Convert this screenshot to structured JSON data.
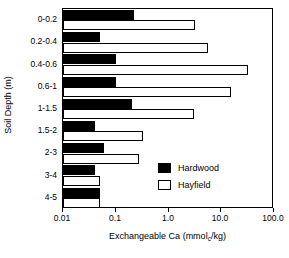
{
  "chart_data": {
    "type": "bar",
    "orientation": "horizontal",
    "title": "",
    "xlabel": "Exchangeable Ca (mmol",
    "xlabel_sub": "c",
    "xlabel_tail": "/kg)",
    "xlabel_full": "Exchangeable Ca (mmolc/kg)",
    "ylabel": "Soil Depth (m)",
    "xscale": "log",
    "xlim": [
      0.01,
      100.0
    ],
    "grid": false,
    "categories": [
      "0-0.2",
      "0.2-0.4",
      "0.4-0.6",
      "0.6-1",
      "1-1.5",
      "1.5-2",
      "2-3",
      "3-4",
      "4-5"
    ],
    "xtick_labels": [
      "0.01",
      "0.1",
      "1.0",
      "10.0",
      "100.0"
    ],
    "xtick_values": [
      0.01,
      0.1,
      1.0,
      10.0,
      100.0
    ],
    "series": [
      {
        "name": "Hardwood",
        "color": "#000000",
        "fill": "solid",
        "values": [
          0.22,
          0.05,
          0.1,
          0.1,
          0.2,
          0.04,
          0.06,
          0.04,
          0.05
        ]
      },
      {
        "name": "Hayfield",
        "color": "#ffffff",
        "fill": "open",
        "values": [
          3.2,
          5.5,
          32.0,
          15.0,
          3.0,
          0.33,
          0.27,
          0.05,
          0.05
        ]
      }
    ],
    "legend": {
      "position": "inside-lower-right",
      "entries": [
        {
          "label": "Hardwood",
          "fill": "solid"
        },
        {
          "label": "Hayfield",
          "fill": "open"
        }
      ]
    }
  }
}
